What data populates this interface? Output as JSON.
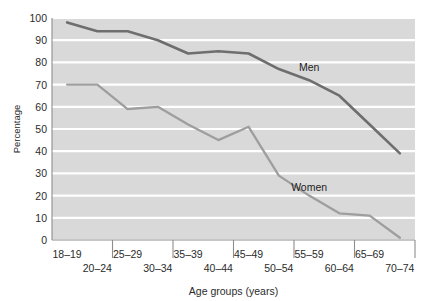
{
  "chart_data": {
    "type": "line",
    "title": "",
    "xlabel": "Age groups (years)",
    "ylabel": "Percentage",
    "categories": [
      "18–19",
      "20–24",
      "25–29",
      "30–34",
      "35–39",
      "40–44",
      "45–49",
      "50–54",
      "55–59",
      "60–64",
      "65–69",
      "70–74"
    ],
    "ylim": [
      0,
      100
    ],
    "yticks": [
      0,
      10,
      20,
      30,
      40,
      50,
      60,
      70,
      80,
      90,
      100
    ],
    "ytick_labels": [
      "0",
      "10",
      "20",
      "30",
      "40",
      "50",
      "60",
      "70",
      "80",
      "90",
      "100"
    ],
    "grid": "horizontal-white-on-gray-bands",
    "legend_position": "inline-annotations",
    "series": [
      {
        "name": "Men",
        "color": "#6e6e6e",
        "label_text": "Men",
        "values": [
          98,
          94,
          94,
          90,
          84,
          85,
          84,
          77,
          72,
          65,
          52,
          39
        ]
      },
      {
        "name": "Women",
        "color": "#9e9e9e",
        "label_text": "Women",
        "values": [
          70,
          70,
          59,
          60,
          52,
          45,
          51,
          29,
          20,
          12,
          11,
          1
        ]
      }
    ],
    "annotations": [
      {
        "text": "Men",
        "x_category": "55–59",
        "y_value": 76
      },
      {
        "text": "Women",
        "x_category": "55–59",
        "y_value": 22
      }
    ]
  },
  "colors": {
    "plot_background": "#d9d9d9",
    "gridline": "#ffffff",
    "axis": "#8d8d8d",
    "men_line": "#6e6e6e",
    "women_line": "#9e9e9e",
    "text": "#2b2b2b"
  }
}
